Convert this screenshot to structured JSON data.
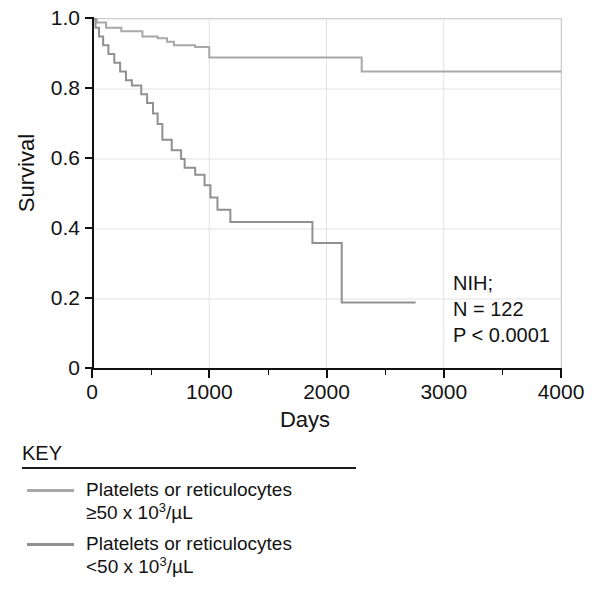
{
  "chart_data": {
    "type": "line",
    "subtype": "kaplan-meier-step",
    "title": "",
    "xlabel": "Days",
    "ylabel": "Survival",
    "xlim": [
      0,
      4000
    ],
    "ylim": [
      0,
      1.0
    ],
    "xticks": [
      0,
      1000,
      2000,
      3000,
      4000
    ],
    "xtick_labels": [
      "0",
      "1000",
      "2000",
      "3000",
      "4000"
    ],
    "xticks_minor": [
      500,
      1500,
      2500,
      3500
    ],
    "yticks": [
      0,
      0.2,
      0.4,
      0.6,
      0.8,
      1.0
    ],
    "ytick_labels": [
      "0",
      "0.2",
      "0.4",
      "0.6",
      "0.8",
      "1.0"
    ],
    "grid": true,
    "grid_color": "#e2e2e2",
    "legend_position": "below-plot",
    "annotations": [
      "NIH;",
      "N = 122",
      "P < 0.0001"
    ],
    "series": [
      {
        "name": "Platelets or reticulocytes ≥50 x 10³/µL",
        "color": "#a8a8a8",
        "points": [
          [
            0,
            1.0
          ],
          [
            40,
            1.0
          ],
          [
            40,
            0.99
          ],
          [
            120,
            0.99
          ],
          [
            120,
            0.975
          ],
          [
            250,
            0.975
          ],
          [
            250,
            0.965
          ],
          [
            430,
            0.965
          ],
          [
            430,
            0.95
          ],
          [
            560,
            0.95
          ],
          [
            560,
            0.945
          ],
          [
            640,
            0.945
          ],
          [
            640,
            0.935
          ],
          [
            700,
            0.935
          ],
          [
            700,
            0.925
          ],
          [
            880,
            0.925
          ],
          [
            880,
            0.92
          ],
          [
            1000,
            0.92
          ],
          [
            1000,
            0.89
          ],
          [
            2300,
            0.89
          ],
          [
            2300,
            0.85
          ],
          [
            4000,
            0.85
          ]
        ]
      },
      {
        "name": "Platelets or reticulocytes <50 x 10³/µL",
        "color": "#909090",
        "points": [
          [
            0,
            1.0
          ],
          [
            30,
            1.0
          ],
          [
            30,
            0.975
          ],
          [
            60,
            0.975
          ],
          [
            60,
            0.95
          ],
          [
            95,
            0.95
          ],
          [
            95,
            0.925
          ],
          [
            140,
            0.925
          ],
          [
            140,
            0.9
          ],
          [
            190,
            0.9
          ],
          [
            190,
            0.875
          ],
          [
            240,
            0.875
          ],
          [
            240,
            0.85
          ],
          [
            290,
            0.85
          ],
          [
            290,
            0.825
          ],
          [
            340,
            0.825
          ],
          [
            340,
            0.81
          ],
          [
            420,
            0.81
          ],
          [
            420,
            0.785
          ],
          [
            470,
            0.785
          ],
          [
            470,
            0.76
          ],
          [
            520,
            0.76
          ],
          [
            520,
            0.73
          ],
          [
            560,
            0.73
          ],
          [
            560,
            0.7
          ],
          [
            600,
            0.7
          ],
          [
            600,
            0.655
          ],
          [
            680,
            0.655
          ],
          [
            680,
            0.625
          ],
          [
            760,
            0.625
          ],
          [
            760,
            0.6
          ],
          [
            790,
            0.6
          ],
          [
            790,
            0.575
          ],
          [
            880,
            0.575
          ],
          [
            880,
            0.555
          ],
          [
            960,
            0.555
          ],
          [
            960,
            0.525
          ],
          [
            1010,
            0.525
          ],
          [
            1010,
            0.49
          ],
          [
            1070,
            0.49
          ],
          [
            1070,
            0.455
          ],
          [
            1180,
            0.455
          ],
          [
            1180,
            0.42
          ],
          [
            1880,
            0.42
          ],
          [
            1880,
            0.36
          ],
          [
            2130,
            0.36
          ],
          [
            2130,
            0.19
          ],
          [
            2760,
            0.19
          ]
        ]
      }
    ]
  },
  "axes": {
    "y_title": "Survival",
    "x_title": "Days"
  },
  "legend": {
    "title": "KEY",
    "entries": [
      {
        "color": "#a8a8a8",
        "line1": "Platelets or reticulocytes",
        "line2_prefix": "≥50 x 10",
        "line2_sup": "3",
        "line2_suffix": "/µL"
      },
      {
        "color": "#909090",
        "line1": "Platelets or reticulocytes",
        "line2_prefix": "<50 x 10",
        "line2_sup": "3",
        "line2_suffix": "/µL"
      }
    ]
  },
  "annotation": {
    "line1": "NIH;",
    "line2": "N = 122",
    "line3": "P < 0.0001"
  }
}
